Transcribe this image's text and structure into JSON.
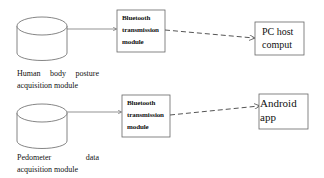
{
  "diagram": {
    "rows": [
      {
        "source": {
          "shape": "cylinder",
          "label_line1_words": [
            "Human",
            "body",
            "posture"
          ],
          "label_line2": "acquisition module"
        },
        "transmitter": {
          "shape": "rectangle",
          "lines": [
            "Bluetooth",
            "transmission",
            "module"
          ]
        },
        "target": {
          "shape": "rectangle",
          "lines": [
            "PC host",
            "comput"
          ]
        },
        "link_source_to_transmitter": "solid-arrow",
        "link_transmitter_to_target": "dashed-arrow"
      },
      {
        "source": {
          "shape": "cylinder",
          "label_line1_words": [
            "Pedometer",
            "data"
          ],
          "label_line2": "acquisition module"
        },
        "transmitter": {
          "shape": "rectangle",
          "lines": [
            "Bluetooth",
            "transmission",
            "module"
          ]
        },
        "target": {
          "shape": "rectangle",
          "lines": [
            "Android",
            "app"
          ]
        },
        "link_source_to_transmitter": "solid-arrow",
        "link_transmitter_to_target": "dashed-arrow"
      }
    ],
    "colors": {
      "stroke": "#555555",
      "text": "#111111",
      "background": "#ffffff"
    }
  }
}
